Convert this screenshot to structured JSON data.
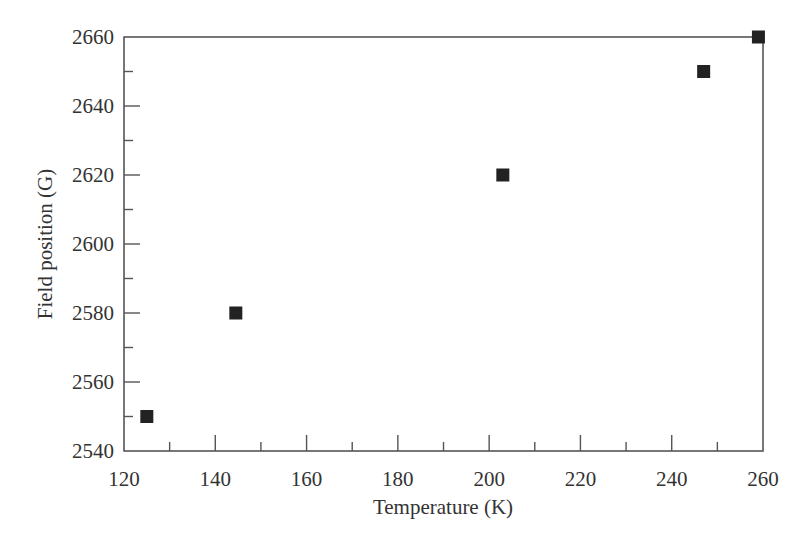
{
  "chart_data": {
    "type": "scatter",
    "title": "",
    "xlabel": "Temperature (K)",
    "ylabel": "Field position (G)",
    "xlim": [
      120,
      260
    ],
    "ylim": [
      2540,
      2660
    ],
    "x_ticks": [
      120,
      140,
      160,
      180,
      200,
      220,
      240,
      260
    ],
    "y_ticks": [
      2540,
      2560,
      2580,
      2600,
      2620,
      2640,
      2660
    ],
    "grid": false,
    "legend": null,
    "marker": "filled-square",
    "marker_color": "#222222",
    "series": [
      {
        "name": "Field position",
        "points": [
          {
            "x": 125,
            "y": 2550
          },
          {
            "x": 144.5,
            "y": 2580
          },
          {
            "x": 203,
            "y": 2620
          },
          {
            "x": 247,
            "y": 2650
          },
          {
            "x": 259,
            "y": 2660
          }
        ]
      }
    ]
  }
}
